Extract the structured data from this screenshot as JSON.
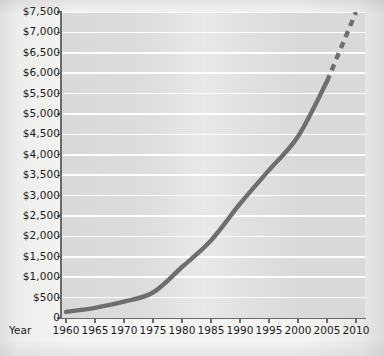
{
  "chart_data": {
    "type": "line",
    "title": "",
    "subtitle": "",
    "xlabel": "Year",
    "ylabel": "",
    "xlim": [
      1960,
      2010
    ],
    "ylim": [
      0,
      7500
    ],
    "grid": true,
    "legend": null,
    "x_tick_labels": [
      "1960",
      "1965",
      "1970",
      "1975",
      "1980",
      "1985",
      "1990",
      "1995",
      "2000",
      "2005",
      "2010"
    ],
    "x_ticks": [
      1960,
      1965,
      1970,
      1975,
      1980,
      1985,
      1990,
      1995,
      2000,
      2005,
      2010
    ],
    "y_tick_labels": [
      "$7,500",
      "$7,000",
      "$6,500",
      "$6,000",
      "$5,500",
      "$5,000",
      "$4,500",
      "$4,000",
      "$3,500",
      "$3,000",
      "$2,500",
      "$2,000",
      "$1,500",
      "$1,000",
      "$500",
      "0"
    ],
    "y_ticks": [
      7500,
      7000,
      6500,
      6000,
      5500,
      5000,
      4500,
      4000,
      3500,
      3000,
      2500,
      2000,
      1500,
      1000,
      500,
      0
    ],
    "series": [
      {
        "name": "Actual",
        "style": "solid",
        "x": [
          1960,
          1965,
          1970,
          1975,
          1980,
          1985,
          1990,
          1995,
          2000,
          2005
        ],
        "values": [
          150,
          250,
          400,
          625,
          1250,
          1900,
          2800,
          3625,
          4450,
          5800
        ]
      },
      {
        "name": "Projected",
        "style": "dashed",
        "x": [
          2005,
          2010
        ],
        "values": [
          5800,
          7500
        ]
      }
    ],
    "colors": {
      "line": "#6e6e6e",
      "plot_background": "#d9d9d7",
      "gridline": "#ffffff",
      "axis": "#6a6a6a",
      "text": "#1b1b1b",
      "page_background": "#f4f4f2"
    }
  }
}
